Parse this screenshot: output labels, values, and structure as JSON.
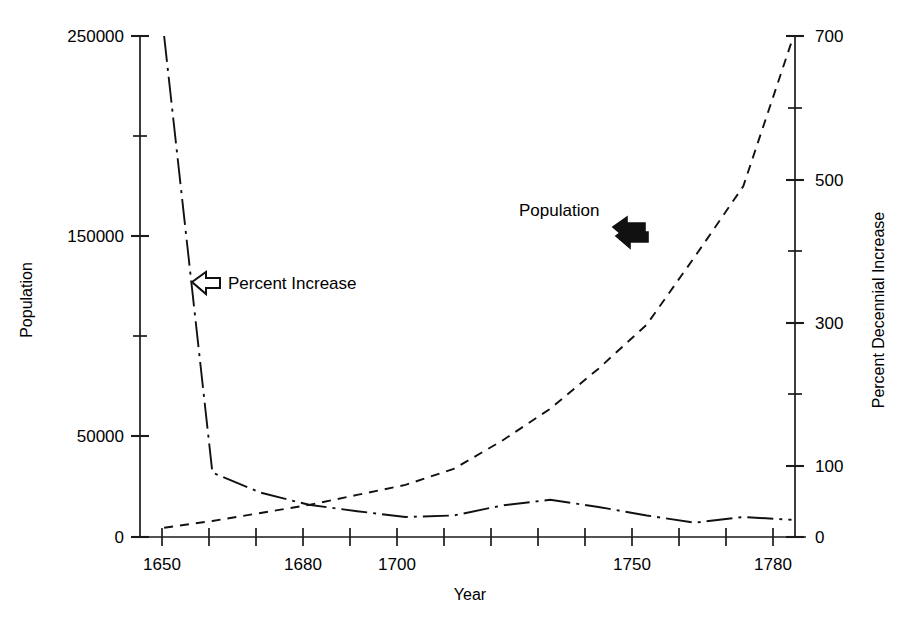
{
  "chart_data": {
    "type": "line",
    "title": "",
    "xlabel": "Year",
    "ylabel": "Population",
    "y2label": "Percent Decennial Increase",
    "grid": false,
    "legend_position": "inline-annotations",
    "xlim": [
      1645,
      1783
    ],
    "ylim": [
      0,
      250000
    ],
    "y2lim": [
      0,
      700
    ],
    "x_ticks": [
      1650,
      1660,
      1670,
      1680,
      1690,
      1700,
      1710,
      1720,
      1730,
      1740,
      1750,
      1760,
      1770,
      1780
    ],
    "x_tick_labels": [
      "1650",
      "",
      "",
      "1680",
      "",
      "1700",
      "",
      "",
      "",
      "",
      "1750",
      "",
      "",
      "1780"
    ],
    "x_labeled_ticks": [
      "1650",
      "1680",
      "1700",
      "1750",
      "1780"
    ],
    "y_ticks": [
      0,
      50000,
      100000,
      150000,
      200000,
      250000
    ],
    "y_tick_labels": [
      "0",
      "50000",
      "",
      "150000",
      "",
      "250000"
    ],
    "y_labeled_ticks": [
      "0",
      "50000",
      "150000",
      "250000"
    ],
    "y2_ticks": [
      0,
      100,
      200,
      300,
      400,
      500,
      600,
      700
    ],
    "y2_tick_labels": [
      "0",
      "100",
      "",
      "300",
      "",
      "500",
      "",
      "700"
    ],
    "y2_labeled_ticks": [
      "0",
      "100",
      "300",
      "500",
      "700"
    ],
    "series": [
      {
        "name": "Population",
        "axis": "left",
        "style": "dashed",
        "x": [
          1650,
          1660,
          1670,
          1680,
          1690,
          1700,
          1710,
          1720,
          1730,
          1740,
          1750,
          1760,
          1770,
          1780
        ],
        "values": [
          4600,
          8000,
          12000,
          16000,
          21000,
          26000,
          34000,
          48000,
          64000,
          84000,
          106000,
          140000,
          175000,
          247000
        ]
      },
      {
        "name": "Percent Increase",
        "axis": "right",
        "style": "dash-dot",
        "x": [
          1650,
          1660,
          1670,
          1680,
          1690,
          1700,
          1710,
          1720,
          1730,
          1740,
          1750,
          1760,
          1770,
          1780
        ],
        "values": [
          700,
          90,
          62,
          45,
          36,
          28,
          30,
          44,
          52,
          42,
          30,
          20,
          28,
          24
        ]
      }
    ],
    "annotations": [
      {
        "text": "Percent Increase",
        "arrow": "left-hollow",
        "points_to": "Percent Increase"
      },
      {
        "text": "Population",
        "arrow": "right-solid",
        "points_to": "Population"
      }
    ],
    "colors": {
      "ink": "#111111",
      "background": "#ffffff"
    }
  }
}
